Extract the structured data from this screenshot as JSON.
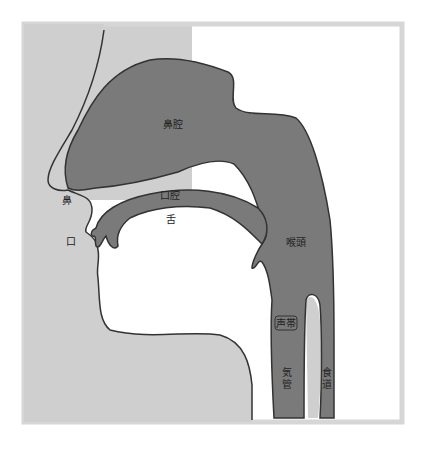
{
  "diagram": {
    "type": "sagittal-section-vocal-tract",
    "colors": {
      "background": "#ffffff",
      "frame": "#d6d6d6",
      "face": "#cfcfcf",
      "tract": "#7a7a7a",
      "outline": "#333333",
      "label": "#222222"
    },
    "labels": {
      "nasal_cavity": "鼻腔",
      "nose": "鼻",
      "oral_cavity": "口腔",
      "tongue": "舌",
      "mouth": "口",
      "larynx": "喉頭",
      "vocal_cords": "声帯",
      "trachea_1": "気",
      "trachea_2": "管",
      "esophagus_1": "食",
      "esophagus_2": "道"
    }
  }
}
